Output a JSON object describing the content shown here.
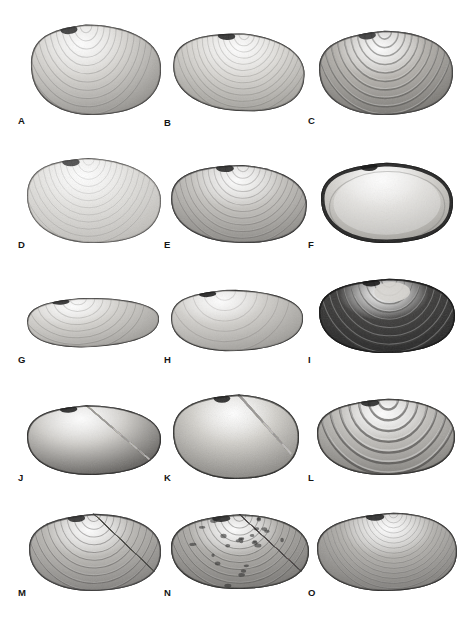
{
  "figure": {
    "type": "scientific-plate",
    "background_color": "#ffffff",
    "rendering": "grayscale-photograph",
    "grid": {
      "columns": 3,
      "rows": 5,
      "total_panels": 15
    },
    "label_color": "#151515"
  },
  "panels": [
    {
      "label": "A",
      "row": 1,
      "col": 1,
      "shape": "rounded-triangular",
      "sculpture": "fine concentric growth lines",
      "tone": "light gray",
      "umbo_marking": "dark patch left of umbo",
      "label_x": 18,
      "label_y": 116,
      "x": 30,
      "y": 18,
      "w": 132,
      "h": 98,
      "body_fill": "#d8d6d2",
      "shadow_fill": "#9c9a96",
      "rim_fill": "#6d6b68",
      "dark_blotch": "#2a2a2a",
      "ring_count": 11,
      "ring_opacity": 0.22,
      "style": "concentric",
      "umbo_x": 0.44,
      "flatten": 0.72,
      "tilt": -3
    },
    {
      "label": "B",
      "row": 1,
      "col": 2,
      "shape": "elongate-oval",
      "sculpture": "fine concentric growth lines",
      "tone": "pale gray",
      "umbo_marking": "small dark bar at umbo",
      "label_x": 164,
      "label_y": 118,
      "x": 172,
      "y": 26,
      "w": 134,
      "h": 86,
      "body_fill": "#dcdad6",
      "shadow_fill": "#a3a19c",
      "rim_fill": "#6a6865",
      "dark_blotch": "#1e1e1e",
      "ring_count": 13,
      "ring_opacity": 0.2,
      "style": "concentric",
      "umbo_x": 0.52,
      "flatten": 0.6,
      "tilt": 4
    },
    {
      "label": "C",
      "row": 1,
      "col": 3,
      "shape": "broad-oval",
      "sculpture": "coarse concentric ridges",
      "tone": "medium gray, mottled",
      "umbo_marking": "dark worn umbo",
      "label_x": 308,
      "label_y": 116,
      "x": 318,
      "y": 24,
      "w": 136,
      "h": 92,
      "body_fill": "#b6b3ae",
      "shadow_fill": "#7c7a76",
      "rim_fill": "#4a4947",
      "dark_blotch": "#2b2b2b",
      "ring_count": 10,
      "ring_opacity": 0.45,
      "style": "concentric-coarse",
      "umbo_x": 0.5,
      "flatten": 0.66,
      "tilt": -2
    },
    {
      "label": "D",
      "row": 2,
      "col": 1,
      "shape": "rounded-triangular",
      "sculpture": "very faint concentric lines",
      "tone": "very pale gray",
      "umbo_marking": "small dark fleck right of umbo",
      "label_x": 18,
      "label_y": 240,
      "x": 26,
      "y": 152,
      "w": 136,
      "h": 92,
      "body_fill": "#e5e4e1",
      "shadow_fill": "#c3c1bd",
      "rim_fill": "#9c9a96",
      "dark_blotch": "#3a3a3a",
      "ring_count": 12,
      "ring_opacity": 0.14,
      "style": "concentric",
      "umbo_x": 0.46,
      "flatten": 0.7,
      "tilt": 0
    },
    {
      "label": "E",
      "row": 2,
      "col": 2,
      "shape": "rounded-triangular",
      "sculpture": "concentric growth lines",
      "tone": "medium gray",
      "umbo_marking": "dark eroded margin at upper-left",
      "label_x": 164,
      "label_y": 240,
      "x": 170,
      "y": 158,
      "w": 138,
      "h": 86,
      "body_fill": "#c6c4c0",
      "shadow_fill": "#8e8c88",
      "rim_fill": "#515050",
      "dark_blotch": "#1c1c1c",
      "ring_count": 12,
      "ring_opacity": 0.26,
      "style": "concentric",
      "umbo_x": 0.52,
      "flatten": 0.62,
      "tilt": 2
    },
    {
      "label": "F",
      "row": 2,
      "col": 3,
      "shape": "broad-rounded",
      "sculpture": "smooth interior, thick dark rim",
      "tone": "pale interior with black border",
      "umbo_marking": "dark thickened margin",
      "label_x": 308,
      "label_y": 240,
      "x": 320,
      "y": 156,
      "w": 134,
      "h": 88,
      "body_fill": "#d9d7d3",
      "shadow_fill": "#a8a6a1",
      "rim_fill": "#1d1d1d",
      "dark_blotch": "#101010",
      "ring_count": 5,
      "ring_opacity": 0.18,
      "style": "interior",
      "umbo_x": 0.5,
      "flatten": 0.64,
      "tilt": -1
    },
    {
      "label": "G",
      "row": 3,
      "col": 1,
      "shape": "flat-elongate-lenticular",
      "sculpture": "faint concentric lines",
      "tone": "pale gray",
      "umbo_marking": "small dark bar at umbo",
      "label_x": 18,
      "label_y": 355,
      "x": 26,
      "y": 290,
      "w": 134,
      "h": 58,
      "body_fill": "#d6d4d0",
      "shadow_fill": "#a9a7a3",
      "rim_fill": "#8a8884",
      "dark_blotch": "#1c1c1c",
      "ring_count": 8,
      "ring_opacity": 0.2,
      "style": "concentric",
      "umbo_x": 0.4,
      "flatten": 0.4,
      "tilt": -4
    },
    {
      "label": "H",
      "row": 3,
      "col": 1,
      "shape": "broad-low-oval",
      "sculpture": "smooth, faint lines",
      "tone": "light gray",
      "umbo_marking": "black wedge at umbo",
      "label_x": 164,
      "label_y": 355,
      "x": 170,
      "y": 282,
      "w": 134,
      "h": 70,
      "body_fill": "#d2d0cc",
      "shadow_fill": "#a5a39f",
      "rim_fill": "#7e7c79",
      "dark_blotch": "#111111",
      "ring_count": 6,
      "ring_opacity": 0.16,
      "style": "concentric",
      "umbo_x": 0.42,
      "flatten": 0.5,
      "tilt": -3
    },
    {
      "label": "I",
      "row": 3,
      "col": 3,
      "shape": "broad-oval",
      "sculpture": "coarse concentric ridges",
      "tone": "very dark gray / near black",
      "umbo_marking": "pale worn patch at umbo",
      "label_x": 308,
      "label_y": 355,
      "x": 318,
      "y": 272,
      "w": 138,
      "h": 82,
      "body_fill": "#3d3c3b",
      "shadow_fill": "#262626",
      "rim_fill": "#141414",
      "dark_blotch": "#0b0b0b",
      "ring_count": 9,
      "ring_opacity": 0.5,
      "style": "concentric-dark",
      "umbo_x": 0.52,
      "flatten": 0.6,
      "tilt": -1
    },
    {
      "label": "J",
      "row": 4,
      "col": 1,
      "shape": "broad-oval",
      "sculpture": "fine radial ribs, dark outer band",
      "tone": "pale center with dark border",
      "umbo_marking": "dark knob at umbo",
      "label_x": 18,
      "label_y": 473,
      "x": 26,
      "y": 398,
      "w": 136,
      "h": 78,
      "body_fill": "#cfcdc9",
      "shadow_fill": "#6b6966",
      "rim_fill": "#3a3937",
      "dark_blotch": "#141414",
      "ring_count": 0,
      "ring_opacity": 0.3,
      "style": "radial",
      "rib_count": 34,
      "umbo_x": 0.45,
      "flatten": 0.58,
      "tilt": -2
    },
    {
      "label": "K",
      "row": 4,
      "col": 2,
      "shape": "fan-shaped",
      "sculpture": "strong radial ribs",
      "tone": "light gray with dark margins",
      "umbo_marking": "pointed umbo at top",
      "label_x": 164,
      "label_y": 473,
      "x": 172,
      "y": 390,
      "w": 128,
      "h": 90,
      "body_fill": "#d2d0cb",
      "shadow_fill": "#8d8b87",
      "rim_fill": "#3b3a38",
      "dark_blotch": "#171717",
      "ring_count": 0,
      "ring_opacity": 0.3,
      "style": "radial-strong",
      "rib_count": 26,
      "umbo_x": 0.52,
      "flatten": 0.78,
      "tilt": 0
    },
    {
      "label": "L",
      "row": 4,
      "col": 3,
      "shape": "broad-oval",
      "sculpture": "bold thick concentric ridges",
      "tone": "medium gray",
      "umbo_marking": "raised umbo",
      "label_x": 308,
      "label_y": 473,
      "x": 316,
      "y": 392,
      "w": 140,
      "h": 84,
      "body_fill": "#c0beba",
      "shadow_fill": "#85837f",
      "rim_fill": "#3e3d3b",
      "dark_blotch": "#1a1a1a",
      "ring_count": 7,
      "ring_opacity": 0.6,
      "style": "concentric-bold",
      "umbo_x": 0.52,
      "flatten": 0.62,
      "tilt": -1
    },
    {
      "label": "M",
      "row": 5,
      "col": 1,
      "shape": "rounded-triangular",
      "sculpture": "reticulate cross-hatched ribs",
      "tone": "medium gray",
      "umbo_marking": "rounded umbo",
      "label_x": 18,
      "label_y": 588,
      "x": 28,
      "y": 508,
      "w": 134,
      "h": 84,
      "body_fill": "#bbb9b5",
      "shadow_fill": "#858380",
      "rim_fill": "#4a4948",
      "dark_blotch": "#232323",
      "ring_count": 10,
      "ring_opacity": 0.38,
      "style": "reticulate",
      "rib_count": 30,
      "umbo_x": 0.5,
      "flatten": 0.68,
      "tilt": -2
    },
    {
      "label": "N",
      "row": 5,
      "col": 2,
      "shape": "rounded-oval",
      "sculpture": "reticulate ribs with dark pits",
      "tone": "medium-dark gray, speckled",
      "umbo_marking": "worn umbo",
      "label_x": 164,
      "label_y": 588,
      "x": 170,
      "y": 508,
      "w": 140,
      "h": 82,
      "body_fill": "#aeaca8",
      "shadow_fill": "#7b7976",
      "rim_fill": "#3f3e3c",
      "dark_blotch": "#1f1f1f",
      "ring_count": 11,
      "ring_opacity": 0.4,
      "style": "reticulate-pitted",
      "rib_count": 30,
      "umbo_x": 0.5,
      "flatten": 0.64,
      "tilt": -1
    },
    {
      "label": "O",
      "row": 5,
      "col": 3,
      "shape": "broad-oval",
      "sculpture": "fine dense concentric lines",
      "tone": "medium gray",
      "umbo_marking": "dark umbo",
      "label_x": 308,
      "label_y": 588,
      "x": 316,
      "y": 506,
      "w": 142,
      "h": 86,
      "body_fill": "#b4b2ae",
      "shadow_fill": "#807e7b",
      "rim_fill": "#4b4a48",
      "dark_blotch": "#1a1a1a",
      "ring_count": 16,
      "ring_opacity": 0.3,
      "style": "concentric-fine",
      "umbo_x": 0.55,
      "flatten": 0.62,
      "tilt": -1
    }
  ]
}
